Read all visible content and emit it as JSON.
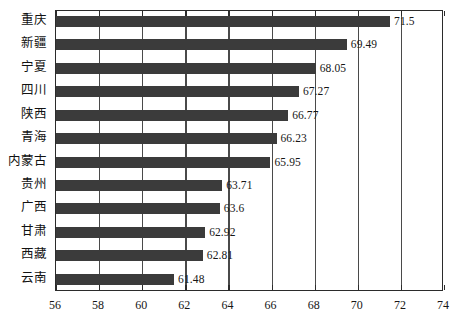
{
  "chart_data": {
    "type": "bar",
    "orientation": "horizontal",
    "title": "",
    "subtitle": "",
    "xlabel": "",
    "ylabel": "",
    "xlim": [
      56,
      74
    ],
    "xticks": [
      56,
      58,
      60,
      62,
      64,
      66,
      68,
      70,
      72,
      74
    ],
    "xtick_labels": [
      "56",
      "58",
      "60",
      "62",
      "64",
      "66",
      "68",
      "70",
      "72",
      "74"
    ],
    "grid": true,
    "grid_axis": "x",
    "legend": null,
    "bar_color": "#3b3b3b",
    "categories": [
      "重庆",
      "新疆",
      "宁夏",
      "四川",
      "陕西",
      "青海",
      "内蒙古",
      "贵州",
      "广西",
      "甘肃",
      "西藏",
      "云南"
    ],
    "values": [
      71.5,
      69.49,
      68.05,
      67.27,
      66.77,
      66.23,
      65.95,
      63.71,
      63.6,
      62.92,
      62.81,
      61.48
    ],
    "value_labels": [
      "71.5",
      "69.49",
      "68.05",
      "67.27",
      "66.77",
      "66.23",
      "65.95",
      "63.71",
      "63.6",
      "62.92",
      "62.81",
      "61.48"
    ],
    "bars": [
      {
        "category": "重庆",
        "value": 71.5,
        "label": "71.5"
      },
      {
        "category": "新疆",
        "value": 69.49,
        "label": "69.49"
      },
      {
        "category": "宁夏",
        "value": 68.05,
        "label": "68.05"
      },
      {
        "category": "四川",
        "value": 67.27,
        "label": "67.27"
      },
      {
        "category": "陕西",
        "value": 66.77,
        "label": "66.77"
      },
      {
        "category": "青海",
        "value": 66.23,
        "label": "66.23"
      },
      {
        "category": "内蒙古",
        "value": 65.95,
        "label": "65.95"
      },
      {
        "category": "贵州",
        "value": 63.71,
        "label": "63.71"
      },
      {
        "category": "广西",
        "value": 63.6,
        "label": "63.6"
      },
      {
        "category": "甘肃",
        "value": 62.92,
        "label": "62.92"
      },
      {
        "category": "西藏",
        "value": 62.81,
        "label": "62.81"
      },
      {
        "category": "云南",
        "value": 61.48,
        "label": "61.48"
      }
    ]
  }
}
